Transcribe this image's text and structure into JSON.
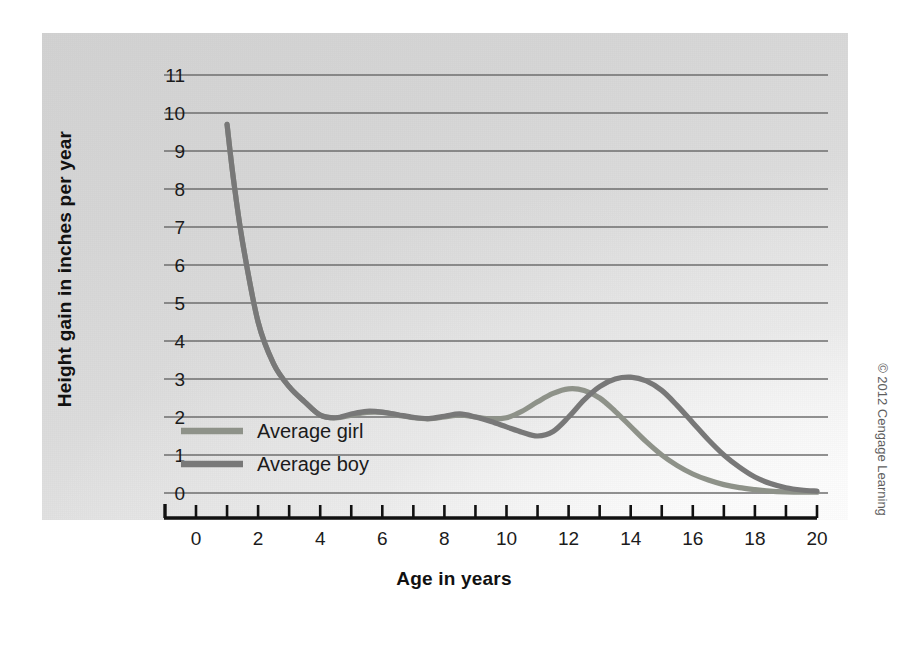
{
  "chart_data": {
    "type": "line",
    "title": "",
    "xlabel": "Age in years",
    "ylabel": "Height gain in inches per year",
    "xlim": [
      0,
      20
    ],
    "ylim": [
      0,
      11
    ],
    "grid": true,
    "grid_axis": "y",
    "legend_position": "inside-left",
    "xticks": [
      0,
      1,
      2,
      3,
      4,
      5,
      6,
      7,
      8,
      9,
      10,
      11,
      12,
      13,
      14,
      15,
      16,
      17,
      18,
      19,
      20
    ],
    "xtick_labels": [
      "0",
      "",
      "2",
      "",
      "4",
      "",
      "6",
      "",
      "8",
      "",
      "10",
      "",
      "12",
      "",
      "14",
      "",
      "16",
      "",
      "18",
      "",
      "20"
    ],
    "yticks": [
      0,
      1,
      2,
      3,
      4,
      5,
      6,
      7,
      8,
      9,
      10,
      11
    ],
    "ytick_labels": [
      "0",
      "1",
      "2",
      "3",
      "4",
      "5",
      "6",
      "7",
      "8",
      "9",
      "10",
      "11"
    ],
    "x": [
      1,
      1.2,
      1.5,
      2,
      2.5,
      3,
      3.5,
      4,
      4.5,
      5,
      5.5,
      6,
      6.5,
      7,
      7.5,
      8,
      8.5,
      9,
      9.5,
      10,
      10.5,
      11,
      11.5,
      12,
      12.5,
      13,
      13.5,
      14,
      14.5,
      15,
      15.5,
      16,
      16.5,
      17,
      17.5,
      18,
      18.5,
      19,
      19.5,
      20
    ],
    "series": [
      {
        "name": "Average girl",
        "color": "#8e9289",
        "values": [
          9.7,
          8.3,
          6.6,
          4.5,
          3.4,
          2.8,
          2.4,
          2.05,
          1.98,
          2.05,
          2.12,
          2.12,
          2.05,
          1.98,
          1.95,
          2.0,
          2.05,
          2.0,
          1.95,
          1.98,
          2.15,
          2.4,
          2.62,
          2.74,
          2.7,
          2.5,
          2.15,
          1.75,
          1.35,
          1.0,
          0.72,
          0.5,
          0.34,
          0.22,
          0.14,
          0.09,
          0.05,
          0.03,
          0.02,
          0.02
        ]
      },
      {
        "name": "Average boy",
        "color": "#787878",
        "values": [
          9.7,
          8.3,
          6.6,
          4.5,
          3.4,
          2.8,
          2.4,
          2.05,
          1.98,
          2.08,
          2.15,
          2.13,
          2.06,
          1.99,
          1.96,
          2.02,
          2.08,
          2.0,
          1.88,
          1.74,
          1.6,
          1.5,
          1.62,
          2.0,
          2.45,
          2.8,
          3.0,
          3.05,
          2.95,
          2.7,
          2.3,
          1.85,
          1.4,
          1.0,
          0.68,
          0.42,
          0.25,
          0.14,
          0.08,
          0.05
        ]
      }
    ]
  },
  "legend": {
    "items": [
      {
        "label": "Average girl",
        "color": "#8e9289"
      },
      {
        "label": "Average boy",
        "color": "#787878"
      }
    ]
  },
  "axes": {
    "x_title": "Age in years",
    "y_title": "Height gain in inches per year"
  },
  "credit": "© 2012 Cengage Learning",
  "colors": {
    "panel_light": "#fafafa",
    "panel_dark": "#d2d2d2",
    "gridline": "#6e6e6e",
    "axis": "#111111",
    "text": "#1b1b1b",
    "girl_line": "#8e9289",
    "boy_line": "#787878"
  }
}
